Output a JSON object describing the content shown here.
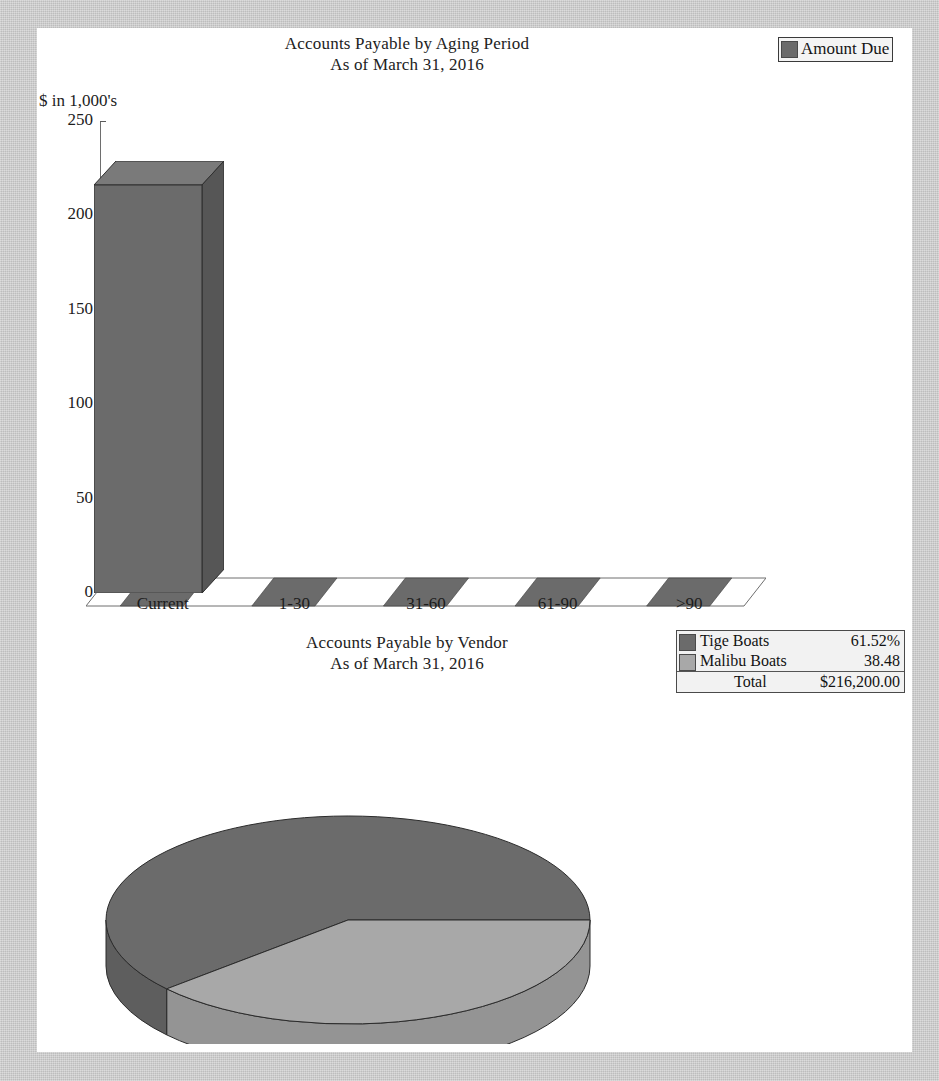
{
  "document": {
    "background_color": "#c8c8c8",
    "paper_color": "#ffffff"
  },
  "colors": {
    "series_dark": "#6b6b6b",
    "series_dark_top": "#7a7a7a",
    "series_dark_side": "#565656",
    "series_light": "#a8a8a8",
    "outline": "#3a3a3a"
  },
  "bar_chart": {
    "title_line1": "Accounts Payable by Aging Period",
    "title_line2": "As of March 31, 2016",
    "y_axis_label": "$ in 1,000's",
    "legend": {
      "label": "Amount Due",
      "swatch_color": "#6b6b6b"
    }
  },
  "pie_chart": {
    "title_line1": "Accounts Payable by Vendor",
    "title_line2": "As of March 31, 2016",
    "legend": {
      "rows": [
        {
          "name": "Tige Boats",
          "value": "61.52%",
          "swatch_color": "#6b6b6b"
        },
        {
          "name": "Malibu Boats",
          "value": "38.48",
          "swatch_color": "#a8a8a8"
        }
      ],
      "total_label": "Total",
      "total_value": "$216,200.00"
    }
  },
  "chart_data": [
    {
      "type": "bar",
      "title": "Accounts Payable by Aging Period / As of March 31, 2016",
      "xlabel": "",
      "ylabel": "$ in 1,000's",
      "categories": [
        "Current",
        "1-30",
        "31-60",
        "61-90",
        ">90"
      ],
      "series": [
        {
          "name": "Amount Due",
          "values": [
            216.2,
            0,
            0,
            0,
            0
          ]
        }
      ],
      "ylim": [
        0,
        250
      ],
      "yticks": [
        0,
        50,
        100,
        150,
        200,
        250
      ],
      "ytick_labels": [
        "0",
        "50",
        "100",
        "150",
        "200",
        "250"
      ],
      "grid": false,
      "legend_position": "top-right",
      "style": "3d"
    },
    {
      "type": "pie",
      "title": "Accounts Payable by Vendor / As of March 31, 2016",
      "labels": [
        "Tige Boats",
        "Malibu Boats"
      ],
      "values": [
        61.52,
        38.48
      ],
      "value_labels": [
        "61.52%",
        "38.48"
      ],
      "total": "$216,200.00",
      "legend_position": "top-right",
      "style": "3d"
    }
  ]
}
